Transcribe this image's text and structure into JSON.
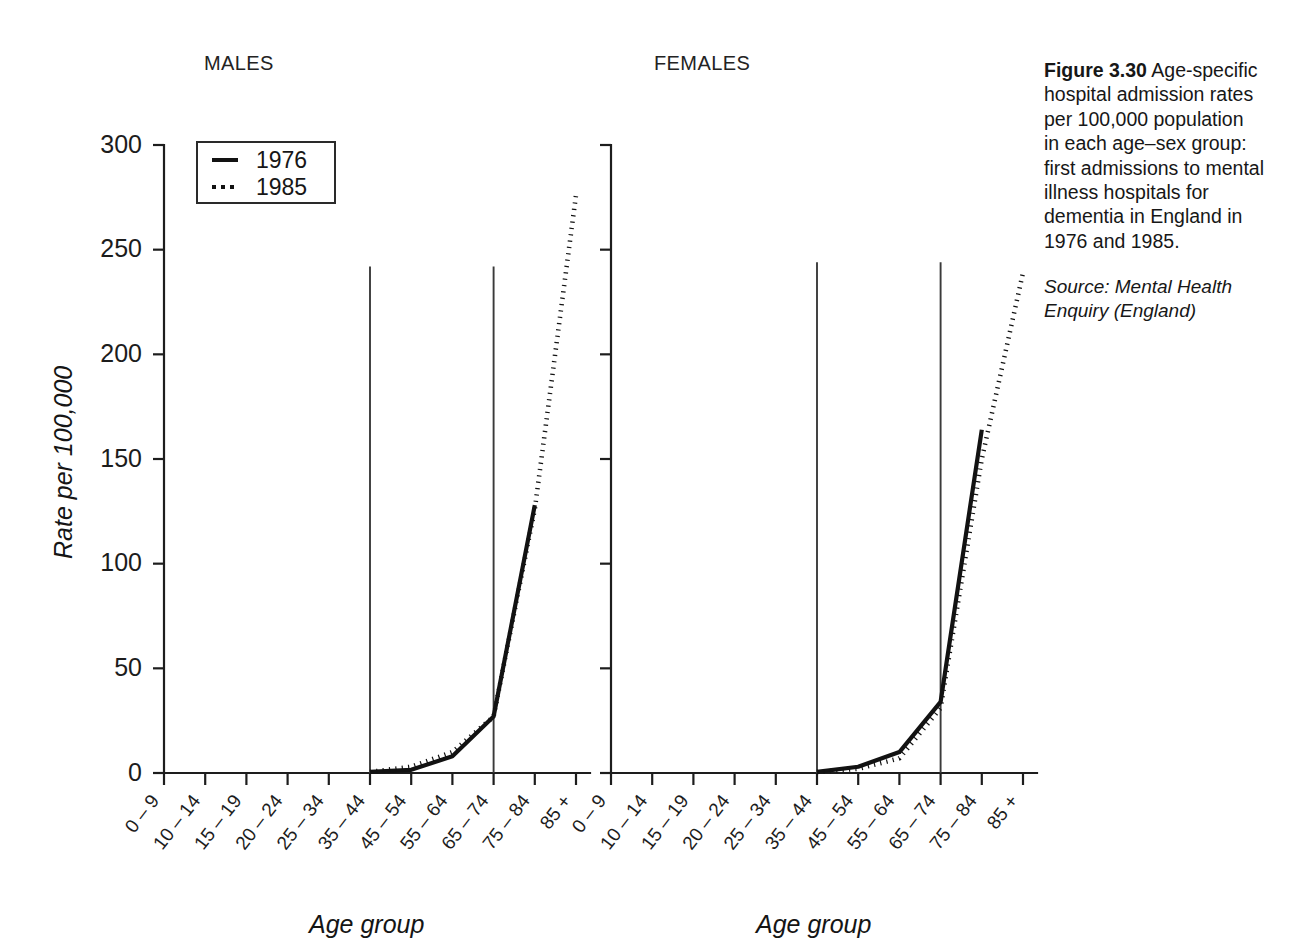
{
  "figure": {
    "caption_heading": "Figure 3.30",
    "caption_body": "Age-specific hospital admission rates per 100,000 population in each age–sex group: first admissions to mental illness hospitals for dementia in England in 1976 and 1985.",
    "source": "Source: Mental Health Enquiry (England)"
  },
  "panels": {
    "males_title": "MALES",
    "females_title": "FEMALES"
  },
  "legend": {
    "items": [
      {
        "label": "1976",
        "style": "solid"
      },
      {
        "label": "1985",
        "style": "dotted"
      }
    ]
  },
  "axes": {
    "ylabel": "Rate per 100,000",
    "xlabel_males": "Age group",
    "xlabel_females": "Age group",
    "yticks": [
      "0",
      "50",
      "100",
      "150",
      "200",
      "250",
      "300"
    ],
    "xticks": [
      "0 – 9",
      "10 – 14",
      "15 – 19",
      "20 – 24",
      "25 – 34",
      "35 – 44",
      "45 – 54",
      "55 – 64",
      "65 – 74",
      "75 – 84",
      "85 +"
    ]
  },
  "chart_data": [
    {
      "type": "line",
      "title": "MALES",
      "xlabel": "Age group",
      "ylabel": "Rate per 100,000",
      "ylim": [
        0,
        300
      ],
      "ytick_values": [
        0,
        50,
        100,
        150,
        200,
        250,
        300
      ],
      "grid": false,
      "legend_position": "top-left",
      "categories": [
        "0 – 9",
        "10 – 14",
        "15 – 19",
        "20 – 24",
        "25 – 34",
        "35 – 44",
        "45 – 54",
        "55 – 64",
        "65 – 74",
        "75 – 84",
        "85 +"
      ],
      "series": [
        {
          "name": "1976",
          "style": "solid",
          "values": [
            null,
            null,
            null,
            null,
            null,
            0.5,
            1.5,
            8,
            27,
            128,
            null
          ]
        },
        {
          "name": "1985",
          "style": "dotted",
          "values": [
            null,
            null,
            null,
            null,
            null,
            0.5,
            3,
            10,
            27,
            126,
            276
          ]
        }
      ],
      "reference_lines": [
        {
          "at_category": "35 – 44",
          "from": 0,
          "to": 242
        },
        {
          "at_category": "65 – 74",
          "from": 0,
          "to": 242
        }
      ]
    },
    {
      "type": "line",
      "title": "FEMALES",
      "xlabel": "Age group",
      "ylabel": "Rate per 100,000",
      "ylim": [
        0,
        300
      ],
      "ytick_values": [
        0,
        50,
        100,
        150,
        200,
        250,
        300
      ],
      "grid": false,
      "legend_position": "none",
      "categories": [
        "0 – 9",
        "10 – 14",
        "15 – 19",
        "20 – 24",
        "25 – 34",
        "35 – 44",
        "45 – 54",
        "55 – 64",
        "65 – 74",
        "75 – 84",
        "85 +"
      ],
      "series": [
        {
          "name": "1976",
          "style": "solid",
          "values": [
            null,
            null,
            null,
            null,
            null,
            0.5,
            3,
            10,
            34,
            164,
            null
          ]
        },
        {
          "name": "1985",
          "style": "dotted",
          "values": [
            null,
            null,
            null,
            null,
            null,
            0.5,
            2,
            7,
            31,
            150,
            239
          ]
        }
      ],
      "reference_lines": [
        {
          "at_category": "35 – 44",
          "from": 0,
          "to": 244
        },
        {
          "at_category": "65 – 74",
          "from": 0,
          "to": 244
        }
      ]
    }
  ]
}
